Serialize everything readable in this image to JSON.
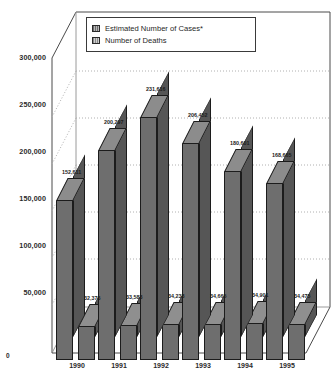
{
  "chart_data": {
    "type": "bar",
    "title": "",
    "subtitle": "",
    "xlabel": "",
    "ylabel": "",
    "categories": [
      "1990",
      "1991",
      "1992",
      "1993",
      "1994",
      "1995"
    ],
    "ylim": [
      0,
      325000
    ],
    "yticks": [
      50000,
      100000,
      150000,
      200000,
      250000,
      300000
    ],
    "ytick_labels": [
      "50,000",
      "100,000",
      "150,000",
      "200,000",
      "250,000",
      "300,000"
    ],
    "origin_label": "0",
    "grid": true,
    "grid_style": "dotted-horizontal",
    "legend_position": "top-center",
    "style": "3d-column",
    "series": [
      {
        "name": "Estimated Number of Cases*",
        "color": "#6e6e6e",
        "values": [
          152611,
          200297,
          231616,
          206452,
          180601,
          168665
        ],
        "labels": [
          "152,611",
          "200,297",
          "231,616",
          "206,452",
          "180,601",
          "168,665"
        ]
      },
      {
        "name": "Number of Deaths",
        "color": "#6e6e6e",
        "values": [
          32376,
          33583,
          34238,
          34665,
          34901,
          34475
        ],
        "labels": [
          "32,376",
          "33,583",
          "34,238",
          "34,665",
          "34,901",
          "34,475"
        ]
      }
    ]
  },
  "legend": {
    "items": [
      {
        "label": "Estimated Number of Cases*",
        "swatch": "series-1-swatch"
      },
      {
        "label": "Number of Deaths",
        "swatch": "series-2-swatch"
      }
    ]
  }
}
